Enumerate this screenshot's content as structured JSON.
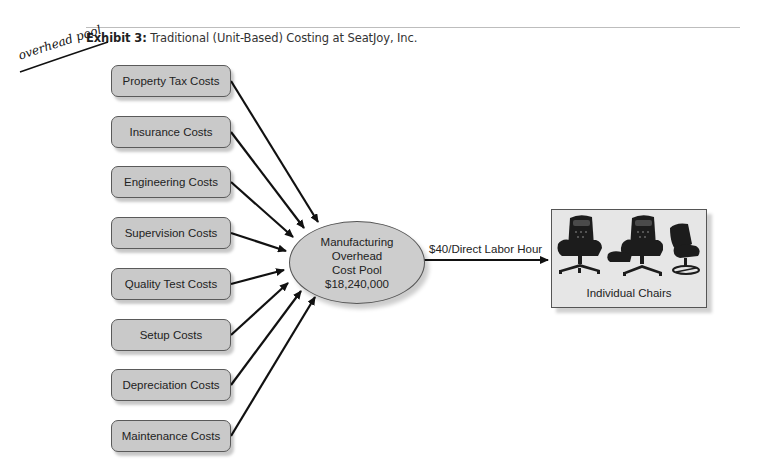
{
  "header": {
    "exhibit_label": "Exhibit 3:",
    "title": "Traditional (Unit-Based) Costing at SeatJoy, Inc."
  },
  "annotation": {
    "handwritten_text": "overhead pool"
  },
  "cost_sources": [
    {
      "label": "Property Tax Costs",
      "top": 65
    },
    {
      "label": "Insurance Costs",
      "top": 116
    },
    {
      "label": "Engineering Costs",
      "top": 166
    },
    {
      "label": "Supervision Costs",
      "top": 217
    },
    {
      "label": "Quality Test Costs",
      "top": 268
    },
    {
      "label": "Setup Costs",
      "top": 319
    },
    {
      "label": "Depreciation Costs",
      "top": 369
    },
    {
      "label": "Maintenance Costs",
      "top": 420
    }
  ],
  "cost_pool": {
    "line1": "Manufacturing",
    "line2": "Overhead",
    "line3": "Cost Pool",
    "amount": "$18,240,000"
  },
  "allocation": {
    "rate_label": "$40/Direct Labor Hour"
  },
  "products": {
    "label": "Individual Chairs",
    "items": [
      "executive-chair",
      "executive-chair-with-ottoman",
      "swivel-lounge-chair"
    ]
  },
  "colors": {
    "box_fill": "#c9c9c9",
    "pool_fill": "#cdcdcd",
    "product_fill": "#e6e6e6",
    "arrow": "#111111",
    "rule": "#bdbdbd"
  }
}
